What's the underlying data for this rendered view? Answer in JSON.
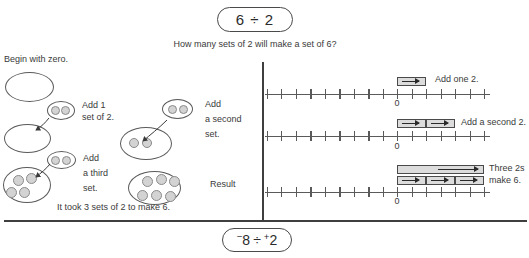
{
  "header": {
    "pill": "6 ÷ 2",
    "question": "How many sets of 2 will make a set of 6?"
  },
  "sets_panel": {
    "begin_label": "Begin with zero.",
    "step1": {
      "line1": "Add 1",
      "line2": "set of 2."
    },
    "step2": {
      "line1": "Add",
      "line2": "a second",
      "line3": "set."
    },
    "step3": {
      "line1": "Add",
      "line2": "a third",
      "line3": "set."
    },
    "result_label": "Result",
    "caption": "It took 3 sets of 2 to make 6.",
    "dot_counts": {
      "start": 0,
      "set_size": 2,
      "after_second_set": 4,
      "result": 6
    }
  },
  "numberline_panel": {
    "line1": {
      "label": "Add one 2.",
      "zero": "0",
      "jumps": 1,
      "jump_size": 2
    },
    "line2": {
      "label": "Add a second 2.",
      "zero": "0",
      "jumps": 2,
      "jump_size": 2
    },
    "line3": {
      "label_line1": "Three 2s",
      "label_line2": "make 6.",
      "zero": "0",
      "jumps": 3,
      "jump_size": 2
    }
  },
  "footer": {
    "pill": {
      "sign1": "−",
      "num1": "8",
      "op": "÷",
      "sign2": "+",
      "num2": "2"
    }
  },
  "colors": {
    "ink": "#3a3a3a",
    "shape_fill": "#d3d3d3",
    "bar_fill": "#dcdcdc",
    "line": "#5a5a5a"
  }
}
